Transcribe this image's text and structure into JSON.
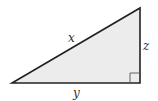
{
  "diagram": {
    "type": "right-triangle",
    "vertices": {
      "left": [
        12,
        83
      ],
      "right_angle": [
        140,
        83
      ],
      "top": [
        140,
        8
      ]
    },
    "sides": {
      "hypotenuse": {
        "label": "x",
        "pos": [
          70,
          41
        ]
      },
      "vertical": {
        "label": "z",
        "pos": [
          145,
          49
        ]
      },
      "base": {
        "label": "y",
        "pos": [
          76,
          96
        ]
      }
    },
    "right_angle_marker_size": 10,
    "colors": {
      "fill": "#ececec",
      "stroke": "#222222",
      "label": "#333333"
    }
  }
}
